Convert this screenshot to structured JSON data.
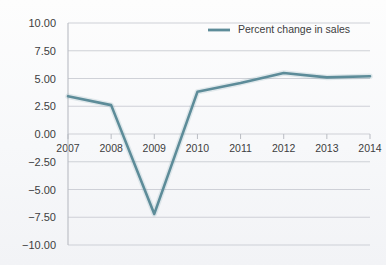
{
  "chart_data": {
    "type": "line",
    "title": "",
    "xlabel": "",
    "ylabel": "",
    "categories": [
      "2007",
      "2008",
      "2009",
      "2010",
      "2011",
      "2012",
      "2013",
      "2014"
    ],
    "x": [
      2007,
      2008,
      2009,
      2010,
      2011,
      2012,
      2013,
      2014
    ],
    "series": [
      {
        "name": "Percent change in sales",
        "color": "#5d8c99",
        "values": [
          3.4,
          2.6,
          -7.2,
          3.8,
          4.6,
          5.5,
          5.1,
          5.2
        ]
      }
    ],
    "ylim": [
      -10.0,
      10.0
    ],
    "ytick_labels": [
      "10.00",
      "7.50",
      "5.00",
      "2.50",
      "0.00",
      "-2.50",
      "-5.00",
      "-7.50",
      "-10.00"
    ],
    "ytick_values": [
      10.0,
      7.5,
      5.0,
      2.5,
      0.0,
      -2.5,
      -5.0,
      -7.5,
      -10.0
    ],
    "grid": true,
    "legend_position": "top-right",
    "legend_entries": [
      "Percent change in sales"
    ]
  },
  "colors": {
    "series": "#5d8c99",
    "gridline": "#c9ccd2",
    "axis": "#b9bcc3",
    "text": "#3d3d40",
    "background": "#f8f9fb"
  }
}
